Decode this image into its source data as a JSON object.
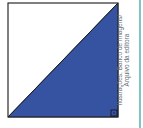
{
  "figure": {
    "square": {
      "x": 8,
      "y": 3,
      "size": 114
    },
    "shaded_region": "lower-right-triangle",
    "right_angle_marker": "bottom-right",
    "colors": {
      "outline": "#2b2b2b",
      "fill": "#3553a0",
      "background": "#ffffff",
      "edge_line": "#7cc6c6"
    }
  },
  "credit": {
    "line1": "Ilustrações: Banco de imagens/",
    "line2": "Arquivo da editora"
  }
}
